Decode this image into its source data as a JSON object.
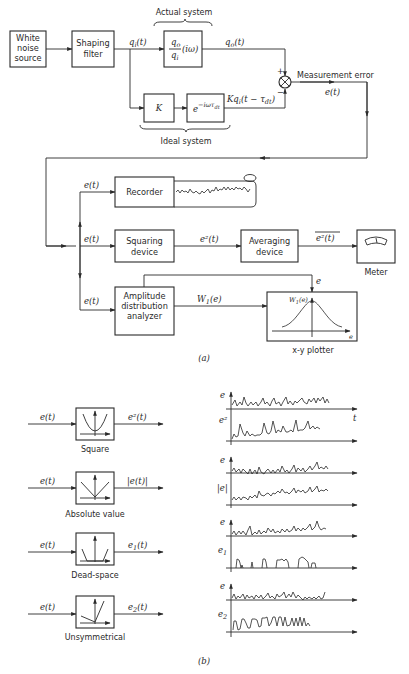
{
  "part_a": {
    "caption": "(a)",
    "blocks": {
      "white_noise": [
        "White",
        "noise",
        "source"
      ],
      "shaping_filter": [
        "Shaping",
        "filter"
      ],
      "actual_tf_num": "q",
      "actual_tf_num_sub": "o",
      "actual_tf_den": "q",
      "actual_tf_den_sub": "i",
      "actual_tf_arg": "(iω)",
      "gain": "K",
      "delay": "e",
      "delay_exp": "−iωτ",
      "delay_exp_sub": "dt",
      "recorder": "Recorder",
      "squaring": [
        "Squaring",
        "device"
      ],
      "averaging": [
        "Averaging",
        "device"
      ],
      "meter_label": "Meter",
      "amplitude": [
        "Amplitude",
        "distribution",
        "analyzer"
      ],
      "plotter_label": "x-y plotter"
    },
    "labels": {
      "actual_system": "Actual system",
      "ideal_system": "Ideal system",
      "qi": "q",
      "qi_sub": "i",
      "qi_arg": "(t)",
      "qo": "q",
      "qo_sub": "o",
      "qo_arg": "(t)",
      "kqi": "Kq",
      "kqi_sub": "i",
      "kqi_arg": "(t − τ",
      "kqi_arg_sub": "dt",
      "kqi_close": ")",
      "plus": "+",
      "minus": "−",
      "measurement_error": "Measurement error",
      "et": "e(t)",
      "e2t": "e²(t)",
      "e2bar": "e²(t)",
      "w1e": "W",
      "w1e_sub": "1",
      "w1e_arg": "(e)",
      "plot_y": "W",
      "plot_y_sub": "1",
      "plot_y_arg": "(e)",
      "plot_x": "e",
      "e_in": "e"
    }
  },
  "part_b": {
    "caption": "(b)",
    "nonlinearities": [
      {
        "name": "Square",
        "input": "e(t)",
        "output": "e²(t)"
      },
      {
        "name": "Absolute value",
        "input": "e(t)",
        "output": "|e(t)|"
      },
      {
        "name": "Dead-space",
        "input": "e(t)",
        "output": "e",
        "output_sub": "1",
        "output_arg": "(t)"
      },
      {
        "name": "Unsymmetrical",
        "input": "e(t)",
        "output": "e",
        "output_sub": "2",
        "output_arg": "(t)"
      }
    ],
    "waveform_axes": [
      {
        "label": "e",
        "x_label": "t"
      },
      {
        "label": "e²"
      },
      {
        "label": "e"
      },
      {
        "label": "|e|"
      },
      {
        "label": "e"
      },
      {
        "label": "e",
        "sub": "1"
      },
      {
        "label": "e"
      },
      {
        "label": "e",
        "sub": "2"
      }
    ]
  }
}
